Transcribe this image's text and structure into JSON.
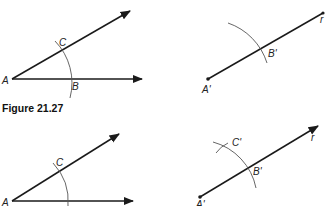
{
  "caption": "Figure 21.27",
  "panels": {
    "top_left": {
      "labels": {
        "vertex": "A",
        "upper": "C",
        "lower": "B"
      }
    },
    "top_right": {
      "labels": {
        "vertex": "A'",
        "intersect": "B'",
        "ray": "r"
      }
    },
    "bottom_left": {
      "labels": {
        "vertex": "A",
        "upper": "C"
      }
    },
    "bottom_right": {
      "labels": {
        "vertex": "A'",
        "intersect": "B'",
        "mark": "C'",
        "ray": "r"
      }
    }
  },
  "colors": {
    "line": "#1a1a1a",
    "arc": "#555555",
    "text": "#222222"
  }
}
